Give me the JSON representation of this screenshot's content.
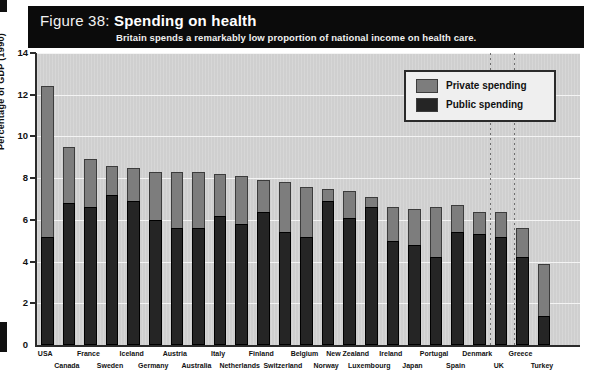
{
  "figure": {
    "number_label": "Figure 38:",
    "title": "Spending on health",
    "subtitle": "Britain spends a remarkably low proportion of national income on health care."
  },
  "legend": {
    "position": "top-right",
    "items": [
      {
        "label": "Private spending",
        "color": "#7d7d7d",
        "name": "private-spending"
      },
      {
        "label": "Public spending",
        "color": "#252525",
        "name": "public-spending"
      }
    ]
  },
  "colors": {
    "header_background": "#0b0b0b",
    "plot_background": "#cfcfcf",
    "private": "#7d7d7d",
    "public": "#252525",
    "axis": "#2b2b2b",
    "gridline": "#f4f4f4"
  },
  "chart_data": {
    "type": "bar",
    "title": "Spending on health",
    "subtitle": "Britain spends a remarkably low proportion of national income on health care.",
    "xlabel": "",
    "ylabel": "Percentage of GDP (1990)",
    "ylim": [
      0,
      14
    ],
    "yticks": [
      0,
      2,
      4,
      6,
      8,
      10,
      12,
      14
    ],
    "grid": true,
    "stacked": true,
    "legend": [
      "Private spending",
      "Public spending"
    ],
    "categories": [
      "USA",
      "Canada",
      "France",
      "Sweden",
      "Iceland",
      "Germany",
      "Austria",
      "Australia",
      "Italy",
      "Netherlands",
      "Finland",
      "Switzerland",
      "Belgium",
      "Norway",
      "New Zealand",
      "Luxembourg",
      "Ireland",
      "Japan",
      "Portugal",
      "Spain",
      "Denmark",
      "UK",
      "Greece",
      "Turkey"
    ],
    "series": [
      {
        "name": "Public spending",
        "values": [
          5.2,
          6.8,
          6.6,
          7.2,
          6.9,
          6.0,
          5.6,
          5.6,
          6.2,
          5.8,
          6.4,
          5.4,
          5.2,
          6.9,
          6.1,
          6.6,
          5.0,
          4.8,
          4.2,
          5.4,
          5.3,
          5.2,
          4.2,
          1.4
        ]
      },
      {
        "name": "Private spending",
        "values": [
          7.2,
          2.7,
          2.3,
          1.4,
          1.6,
          2.3,
          2.7,
          2.7,
          2.0,
          2.3,
          1.5,
          2.4,
          2.4,
          0.6,
          1.3,
          0.5,
          1.6,
          1.7,
          2.4,
          1.3,
          1.1,
          1.2,
          1.4,
          2.5
        ]
      }
    ],
    "totals": [
      12.4,
      9.5,
      8.9,
      8.6,
      8.5,
      8.3,
      8.3,
      8.3,
      8.2,
      8.1,
      7.9,
      7.8,
      7.6,
      7.5,
      7.4,
      7.1,
      6.6,
      6.5,
      6.6,
      6.7,
      6.4,
      6.4,
      5.6,
      3.9
    ]
  },
  "annotations": {
    "uk_marker_dotted_lines": 2
  }
}
